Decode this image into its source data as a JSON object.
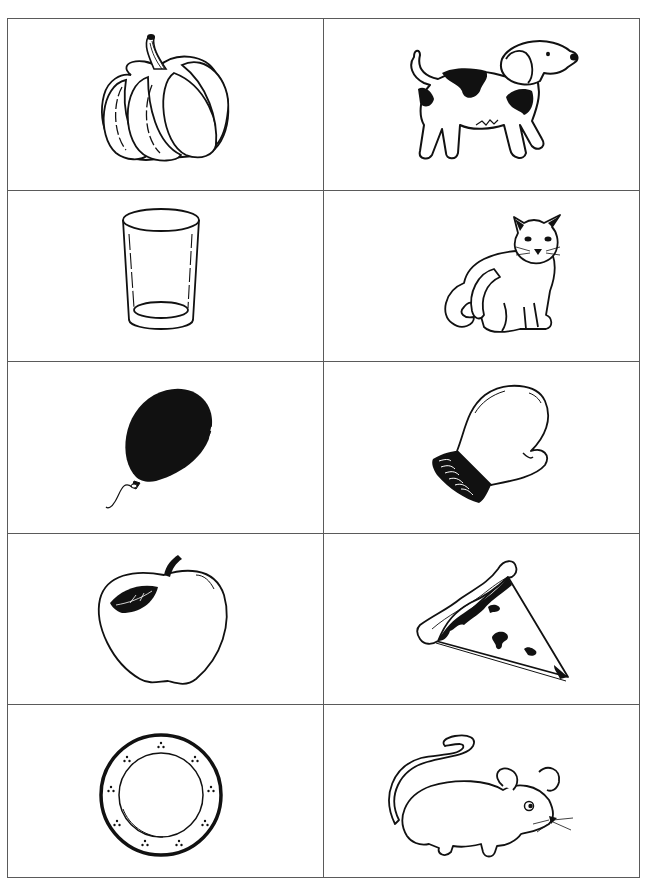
{
  "worksheet": {
    "rows": 5,
    "columns": 2,
    "border_color": "#5a5a5a",
    "ink_color": "#111111",
    "cells": [
      {
        "row": 1,
        "col": 1,
        "picture": "pumpkin"
      },
      {
        "row": 1,
        "col": 2,
        "picture": "dog"
      },
      {
        "row": 2,
        "col": 1,
        "picture": "glass"
      },
      {
        "row": 2,
        "col": 2,
        "picture": "cat"
      },
      {
        "row": 3,
        "col": 1,
        "picture": "balloon"
      },
      {
        "row": 3,
        "col": 2,
        "picture": "mitten"
      },
      {
        "row": 4,
        "col": 1,
        "picture": "apple"
      },
      {
        "row": 4,
        "col": 2,
        "picture": "pizza slice"
      },
      {
        "row": 5,
        "col": 1,
        "picture": "plate"
      },
      {
        "row": 5,
        "col": 2,
        "picture": "mouse"
      }
    ]
  }
}
